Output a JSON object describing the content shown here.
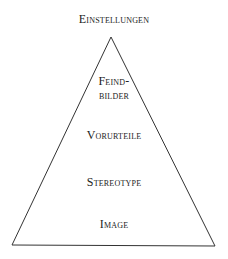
{
  "diagram": {
    "type": "pyramid",
    "top_label": "Einstellungen",
    "levels": [
      {
        "line1": "Feind-",
        "line2": "bilder"
      },
      {
        "line1": "Vorurteile"
      },
      {
        "line1": "Stereotype"
      },
      {
        "line1": "Image"
      }
    ],
    "colors": {
      "line": "#333333",
      "text": "#222222",
      "background": "#ffffff"
    }
  }
}
